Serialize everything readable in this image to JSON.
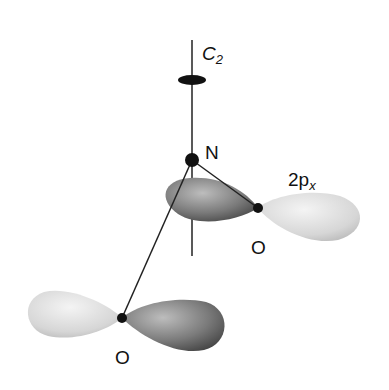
{
  "diagram": {
    "labels": {
      "axis": "C",
      "axis_sub": "2",
      "nitrogen": "N",
      "orbital": "2p",
      "orbital_sub": "x",
      "oxygen_right": "O",
      "oxygen_left": "O"
    },
    "colors": {
      "dark_lobe": "#6a6a6a",
      "light_lobe": "#d8d8d8",
      "atom": "#111111",
      "line": "#222222"
    }
  }
}
